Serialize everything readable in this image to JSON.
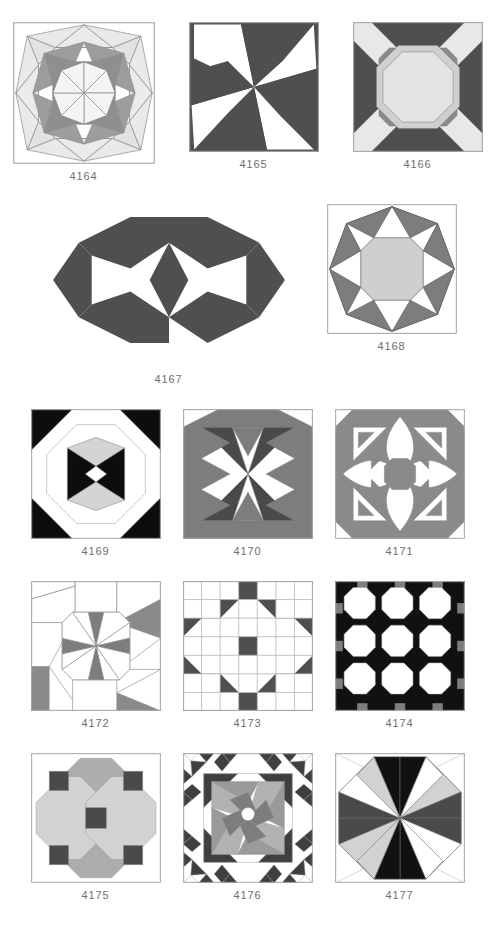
{
  "page": {
    "background": "#ffffff",
    "caption_color": "#6e6e6e"
  },
  "palette": {
    "white": "#ffffff",
    "light_gray": "#d7d7d7",
    "pale_gray": "#e6e6e6",
    "medium_gray": "#9a9a9a",
    "mid_dark_gray": "#7d7d7d",
    "dark_gray": "#4f4f4f",
    "charcoal": "#3f3f3f",
    "black": "#0d0d0d",
    "outline": "#8c8c8c",
    "thin_line": "#a8a8a8"
  },
  "rows": [
    {
      "row_index": 1,
      "blocks": [
        {
          "id": "4164",
          "label": "4164",
          "name": "radial-star-medallion",
          "size": 142
        },
        {
          "id": "4165",
          "label": "4165",
          "name": "eight-blade-pinwheel",
          "size": 130
        },
        {
          "id": "4166",
          "label": "4166",
          "name": "octagon-cross-rays",
          "size": 130
        }
      ]
    },
    {
      "row_index": 2,
      "blocks": [
        {
          "id": "4167",
          "label": "4167",
          "name": "double-hexagon-star",
          "size": 260
        },
        {
          "id": "4168",
          "label": "4168",
          "name": "octagon-point-star",
          "size": 130
        }
      ]
    },
    {
      "row_index": 3,
      "blocks": [
        {
          "id": "4169",
          "label": "4169",
          "name": "octagon-diamond-center",
          "size": 130
        },
        {
          "id": "4170",
          "label": "4170",
          "name": "octagon-x-triangles",
          "size": 130
        },
        {
          "id": "4171",
          "label": "4171",
          "name": "curved-cross-compass",
          "size": 130
        }
      ]
    },
    {
      "row_index": 4,
      "blocks": [
        {
          "id": "4172",
          "label": "4172",
          "name": "octagon-pinwheel-slivers",
          "size": 130
        },
        {
          "id": "4173",
          "label": "4173",
          "name": "four-octagon-grid",
          "size": 130
        },
        {
          "id": "4174",
          "label": "4174",
          "name": "nine-octagon-grid",
          "size": 130
        }
      ]
    },
    {
      "row_index": 5,
      "blocks": [
        {
          "id": "4175",
          "label": "4175",
          "name": "four-large-octagons",
          "size": 130
        },
        {
          "id": "4176",
          "label": "4176",
          "name": "spiral-pinwheel-sawtooth",
          "size": 130
        },
        {
          "id": "4177",
          "label": "4177",
          "name": "octagon-radiating-wedges",
          "size": 130
        }
      ]
    }
  ]
}
